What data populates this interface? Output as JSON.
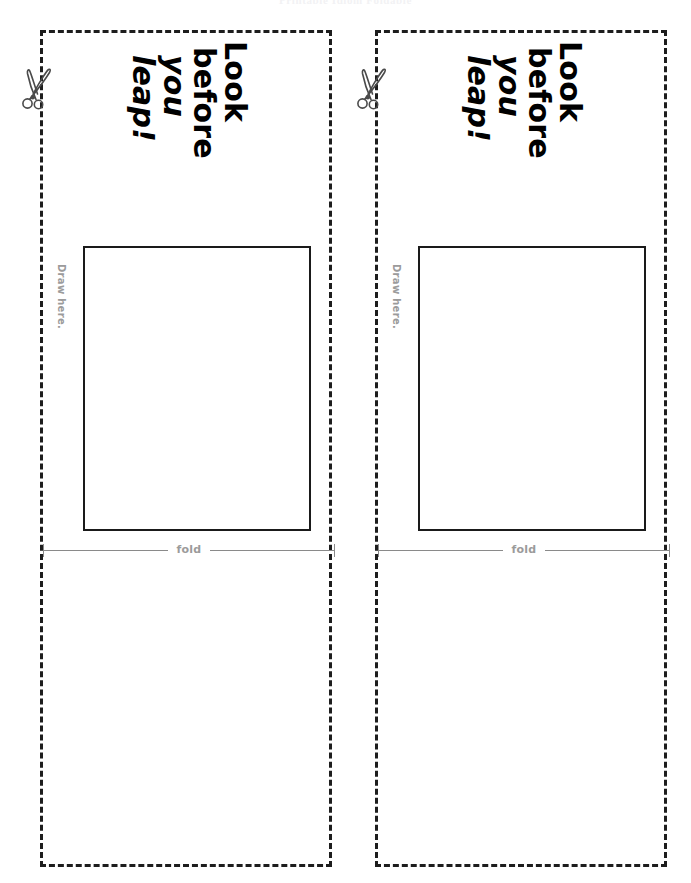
{
  "page": {
    "header_title": "Printable Idiom Foldable",
    "width": 691,
    "height": 883,
    "background": "#ffffff"
  },
  "colors": {
    "cut_border": "#1d1d1d",
    "draw_box_border": "#1a1a1a",
    "fold_line": "#8a8a8a",
    "hint_text": "#9b9b9b",
    "headline_text": "#000000",
    "header_text": "#f2f2f4"
  },
  "icons": {
    "scissors": "scissors-icon"
  },
  "cards": [
    {
      "id": "card-left",
      "scissors_icon": "scissors-icon",
      "headline": {
        "full": "Look before you leap!",
        "lines": [
          "Look",
          "before",
          "you",
          "leap!"
        ],
        "line1": "Look",
        "line2": "before",
        "line3": "you",
        "line4": "leap!"
      },
      "draw_label": "Draw here.",
      "fold_label": "fold"
    },
    {
      "id": "card-right",
      "scissors_icon": "scissors-icon",
      "headline": {
        "full": "Look before you leap!",
        "lines": [
          "Look",
          "before",
          "you",
          "leap!"
        ],
        "line1": "Look",
        "line2": "before",
        "line3": "you",
        "line4": "leap!"
      },
      "draw_label": "Draw here.",
      "fold_label": "fold"
    }
  ]
}
